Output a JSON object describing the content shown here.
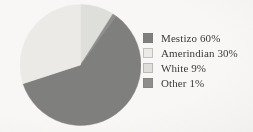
{
  "figure": {
    "background_color": "#f8f7f5",
    "text_color": "#3b3a38"
  },
  "chart_data": {
    "type": "pie",
    "title": "",
    "subtitle": "",
    "xlabel": "",
    "ylabel": "",
    "grid": false,
    "legend_position": "right",
    "start_angle_deg": 0,
    "direction": "clockwise",
    "categories": [
      "Mestizo",
      "Amerindian",
      "White",
      "Other"
    ],
    "values": [
      60,
      30,
      9,
      1
    ],
    "unit": "%",
    "colors": [
      "#7f7f7d",
      "#ebeae7",
      "#dededb",
      "#8e8e8c"
    ],
    "slices": [
      {
        "label": "Mestizo",
        "value": 60,
        "display": "Mestizo 60%",
        "color": "#7f7f7d"
      },
      {
        "label": "Amerindian",
        "value": 30,
        "display": "Amerindian 30%",
        "color": "#ebeae7"
      },
      {
        "label": "White",
        "value": 9,
        "display": "White 9%",
        "color": "#dededb"
      },
      {
        "label": "Other",
        "value": 1,
        "display": "Other 1%",
        "color": "#8e8e8c"
      }
    ]
  },
  "legend": {
    "items": [
      {
        "label": "Mestizo 60%",
        "color": "#7f7f7d"
      },
      {
        "label": "Amerindian 30%",
        "color": "#ebeae7"
      },
      {
        "label": "White 9%",
        "color": "#dededb"
      },
      {
        "label": "Other 1%",
        "color": "#8e8e8c"
      }
    ]
  }
}
